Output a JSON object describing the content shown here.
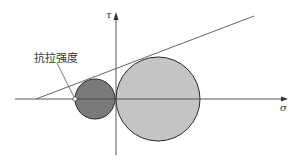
{
  "diagram": {
    "type": "mohr-coulomb-failure-envelope",
    "labels": {
      "tensile_strength": "抗拉强度",
      "tau_axis": "τ",
      "sigma_axis": "σ"
    },
    "colors": {
      "axis": "#444444",
      "small_circle_fill": "#7a7a7a",
      "large_circle_fill": "#c4c4c4",
      "circle_stroke": "#2a2a2a",
      "envelope": "#555555",
      "point_fill": "#ffffff"
    },
    "geometry": {
      "sigma_axis": {
        "x1": 15,
        "y": 99,
        "x2": 287
      },
      "tau_axis": {
        "x": 116,
        "y1": 155,
        "y2": 13
      },
      "small_circle": {
        "cx": 95,
        "cy": 99,
        "r": 20
      },
      "large_circle": {
        "cx": 158,
        "cy": 99,
        "r": 42
      },
      "envelope_line": {
        "x1": 36,
        "y1": 99,
        "x2": 254,
        "y2": 16
      },
      "tensile_point": {
        "cx": 75,
        "cy": 99,
        "r": 2.2
      },
      "leader_line": {
        "x1": 57,
        "y1": 63,
        "x2": 74,
        "y2": 97
      }
    }
  }
}
